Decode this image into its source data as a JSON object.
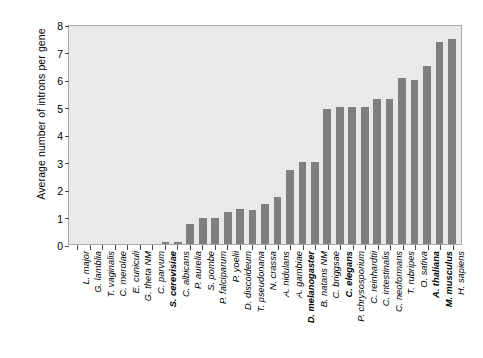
{
  "chart_data": {
    "type": "bar",
    "title": "",
    "xlabel": "",
    "ylabel": "Average number of introns per gene",
    "ylim": [
      0,
      8
    ],
    "yticks": [
      0,
      1,
      2,
      3,
      4,
      5,
      6,
      7,
      8
    ],
    "grid": false,
    "legend": "none",
    "bar_color": "#7f7f7f",
    "plot_background": "#e9e9e9",
    "categories": [
      "L. major",
      "G. lamblia",
      "T. vaginalis",
      "C. merolae",
      "E. cuniculi",
      "G. theta NM",
      "C. parvum",
      "S. cerevisiae",
      "C. albicans",
      "P. aurelia",
      "S. pombe",
      "P. falciparum",
      "P. yoelii",
      "D. discoideum",
      "T. pseudonana",
      "N. crassa",
      "A. nidulans",
      "A. gambiae",
      "D. melanogaster",
      "B. natans NM",
      "C. briggsae",
      "C. elegans",
      "P. chrysosporium",
      "C. reinhardtii",
      "C. intestinalis",
      "C. neoformans",
      "T. rubripes",
      "O. sativa",
      "A. thaliana",
      "M. musculus",
      "H. sapiens"
    ],
    "values": [
      0.0,
      0.0,
      0.0,
      0.0,
      0.0,
      0.0,
      0.0,
      0.07,
      0.09,
      0.73,
      0.94,
      0.96,
      1.16,
      1.26,
      1.24,
      1.46,
      1.7,
      2.68,
      2.97,
      2.97,
      4.9,
      5.0,
      4.99,
      5.0,
      5.29,
      5.29,
      6.02,
      5.96,
      6.49,
      7.36,
      7.47
    ],
    "bold_categories": [
      "S. cerevisiae",
      "D. melanogaster",
      "C. elegans",
      "A. thaliana",
      "M. musculus"
    ]
  }
}
